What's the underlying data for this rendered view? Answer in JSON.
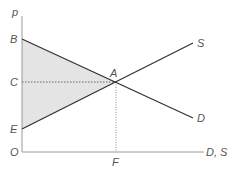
{
  "diagram": {
    "type": "supply-demand",
    "axes": {
      "y_label": "p",
      "x_label": "D, S",
      "origin_label": "O"
    },
    "points": {
      "B": {
        "label": "B",
        "x": 22,
        "y": 39
      },
      "C": {
        "label": "C",
        "x": 22,
        "y": 82
      },
      "E": {
        "label": "E",
        "x": 22,
        "y": 129
      },
      "A": {
        "label": "A",
        "x": 116,
        "y": 82
      },
      "F": {
        "label": "F",
        "x": 116,
        "y": 152
      }
    },
    "curves": {
      "supply": {
        "label": "S",
        "x1": 22,
        "y1": 129,
        "x2": 193,
        "y2": 43
      },
      "demand": {
        "label": "D",
        "x1": 22,
        "y1": 39,
        "x2": 193,
        "y2": 118
      }
    },
    "shaded_region": {
      "vertices": [
        "B",
        "A",
        "E"
      ],
      "color": "#e4e4e4"
    },
    "colors": {
      "line": "#333333",
      "axis": "#999999",
      "dotted": "#666666",
      "label": "#555555"
    }
  }
}
